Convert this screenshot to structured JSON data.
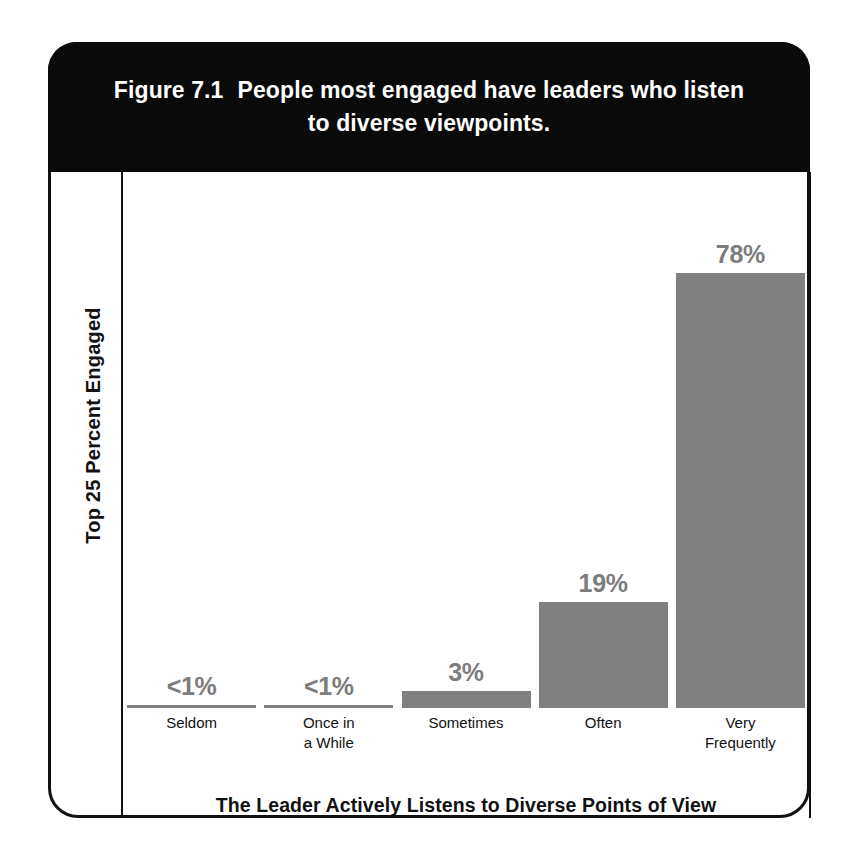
{
  "figure": {
    "number": "Figure 7.1",
    "title": "People most engaged have leaders who listen to diverse viewpoints."
  },
  "chart_data": {
    "type": "bar",
    "xlabel": "The Leader Actively Listens to Diverse Points of View",
    "ylabel": "Top 25 Percent Engaged",
    "categories": [
      "Seldom",
      "Once in a While",
      "Sometimes",
      "Often",
      "Very Frequently"
    ],
    "category_lines": [
      [
        "Seldom"
      ],
      [
        "Once in",
        "a While"
      ],
      [
        "Sometimes"
      ],
      [
        "Often"
      ],
      [
        "Very",
        "Frequently"
      ]
    ],
    "values": [
      0.5,
      0.5,
      3,
      19,
      78
    ],
    "value_labels": [
      "<1%",
      "<1%",
      "3%",
      "19%",
      "78%"
    ],
    "ylim": [
      0,
      96
    ],
    "grid": false,
    "legend": null,
    "bar_color": "#808080",
    "label_color": "#7c7c7c",
    "banner_color": "#0a0a0a",
    "axis_color": "#111111"
  }
}
